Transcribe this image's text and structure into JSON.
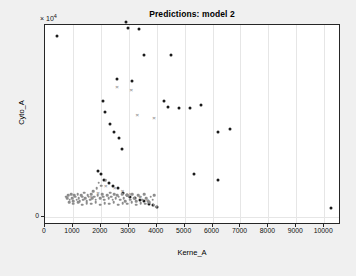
{
  "figure": {
    "background_color": "#f0f0f0",
    "axes_background_color": "#ffffff",
    "axes_border_color": "#262626",
    "grid_color": "#e6e6e6"
  },
  "chart_data": {
    "type": "scatter",
    "title": "Predictions: model 2",
    "xlabel": "Kerne_A",
    "ylabel": "Cyto_A",
    "y_exponent_label": "× 10",
    "y_exponent_power": "4",
    "y_scale_multiplier": 10000,
    "xlim": [
      0,
      10600
    ],
    "ylim": [
      -600,
      13600
    ],
    "grid": true,
    "legend": null,
    "xticks": [
      0,
      1000,
      2000,
      3000,
      4000,
      5000,
      6000,
      7000,
      8000,
      9000,
      10000
    ],
    "xtick_labels": [
      "0",
      "1000",
      "2000",
      "3000",
      "4000",
      "5000",
      "6000",
      "7000",
      "8000",
      "9000",
      "10000"
    ],
    "yticks": [
      0,
      20000,
      40000,
      60000,
      80000,
      100000,
      120000
    ],
    "ytick_labels": [
      "0",
      "2",
      "4",
      "6",
      "8",
      "10",
      "12"
    ],
    "series": [
      {
        "name": "observed",
        "marker": "dot",
        "color": "#1a1a1a",
        "size": 3.0,
        "points": [
          [
            690,
            127000
          ],
          [
            430,
            110500
          ],
          [
            640,
            101000
          ],
          [
            655,
            99500
          ],
          [
            610,
            98000
          ],
          [
            690,
            97500
          ],
          [
            620,
            94000
          ],
          [
            670,
            92500
          ],
          [
            640,
            88000
          ],
          [
            700,
            87500
          ],
          [
            660,
            86500
          ],
          [
            905,
            85000
          ],
          [
            1300,
            84000
          ],
          [
            570,
            81000
          ],
          [
            690,
            80500
          ],
          [
            1130,
            79000
          ],
          [
            1200,
            78500
          ],
          [
            600,
            76000
          ],
          [
            640,
            75500
          ],
          [
            1430,
            75000
          ],
          [
            570,
            73500
          ],
          [
            700,
            72000
          ],
          [
            1180,
            71000
          ],
          [
            530,
            69000
          ],
          [
            600,
            68000
          ],
          [
            1230,
            67500
          ],
          [
            1300,
            66000
          ],
          [
            1700,
            64500
          ],
          [
            1100,
            64000
          ],
          [
            600,
            62500
          ],
          [
            520,
            61000
          ],
          [
            1080,
            61500
          ],
          [
            1400,
            60500
          ],
          [
            1250,
            59000
          ],
          [
            430,
            58000
          ],
          [
            560,
            57500
          ],
          [
            690,
            57000
          ],
          [
            1030,
            57500
          ],
          [
            1160,
            56500
          ],
          [
            1520,
            56000
          ],
          [
            1330,
            55000
          ],
          [
            460,
            53000
          ],
          [
            600,
            52500
          ],
          [
            1030,
            52000
          ],
          [
            1450,
            51500
          ],
          [
            1540,
            50500
          ],
          [
            530,
            49000
          ],
          [
            640,
            48500
          ],
          [
            700,
            48000
          ],
          [
            1100,
            49500
          ],
          [
            1210,
            48000
          ],
          [
            1380,
            47500
          ],
          [
            1460,
            46500
          ],
          [
            410,
            45000
          ],
          [
            560,
            44500
          ],
          [
            1000,
            45500
          ],
          [
            1160,
            44000
          ],
          [
            1300,
            43500
          ],
          [
            1420,
            42500
          ],
          [
            1550,
            44000
          ],
          [
            600,
            41000
          ],
          [
            680,
            40500
          ],
          [
            1060,
            41500
          ],
          [
            1200,
            40000
          ],
          [
            1470,
            40500
          ],
          [
            1570,
            41500
          ],
          [
            430,
            38500
          ],
          [
            520,
            38000
          ],
          [
            960,
            38500
          ],
          [
            1100,
            37000
          ],
          [
            1260,
            36500
          ],
          [
            1680,
            36000
          ],
          [
            1800,
            34000
          ],
          [
            600,
            34500
          ],
          [
            700,
            33500
          ],
          [
            1030,
            33000
          ],
          [
            1180,
            32000
          ],
          [
            460,
            31000
          ],
          [
            1120,
            30500
          ],
          [
            1960,
            29500
          ],
          [
            2880,
            27500
          ],
          [
            4060,
            29500
          ],
          [
            7100,
            29800
          ],
          [
            400,
            26500
          ],
          [
            560,
            26000
          ],
          [
            1330,
            27000
          ],
          [
            1250,
            24000
          ],
          [
            530,
            23000
          ],
          [
            660,
            22000
          ],
          [
            690,
            21500
          ],
          [
            1320,
            20500
          ],
          [
            5030,
            25000
          ],
          [
            5830,
            20800
          ],
          [
            5880,
            20400
          ],
          [
            2290,
            17000
          ],
          [
            2260,
            16000
          ],
          [
            3450,
            18000
          ],
          [
            3680,
            19500
          ],
          [
            3760,
            18500
          ],
          [
            3800,
            20000
          ],
          [
            3880,
            17000
          ],
          [
            4000,
            15700
          ],
          [
            2900,
            13800
          ],
          [
            2980,
            13400
          ],
          [
            3370,
            13300
          ],
          [
            3550,
            11500
          ],
          [
            4510,
            11500
          ],
          [
            5870,
            14000
          ],
          [
            7560,
            15000
          ],
          [
            430,
            12800
          ],
          [
            2580,
            9800
          ],
          [
            3110,
            9600
          ],
          [
            4270,
            8200
          ],
          [
            4420,
            7800
          ],
          [
            4800,
            7700
          ],
          [
            5180,
            7700
          ],
          [
            5570,
            7900
          ],
          [
            6200,
            6000
          ],
          [
            6640,
            6200
          ],
          [
            2080,
            8200
          ],
          [
            2160,
            7400
          ],
          [
            2320,
            6600
          ],
          [
            2480,
            6000
          ],
          [
            2660,
            5600
          ],
          [
            2760,
            4800
          ],
          [
            5320,
            3000
          ],
          [
            6200,
            2600
          ],
          [
            1900,
            3200
          ],
          [
            2010,
            3000
          ],
          [
            2130,
            2600
          ],
          [
            2290,
            2400
          ],
          [
            2430,
            2200
          ],
          [
            2600,
            2000
          ],
          [
            2780,
            1700
          ],
          [
            2930,
            1500
          ],
          [
            3060,
            1400
          ],
          [
            3230,
            1300
          ],
          [
            3400,
            1200
          ],
          [
            3560,
            1100
          ],
          [
            3720,
            900
          ],
          [
            3880,
            800
          ],
          [
            4010,
            700
          ],
          [
            10250,
            600
          ]
        ]
      },
      {
        "name": "predicted",
        "marker": "dot",
        "color": "#8c8c8c",
        "size": 2.6,
        "points": [
          [
            760,
            1400
          ],
          [
            800,
            1300
          ],
          [
            840,
            1500
          ],
          [
            890,
            1200
          ],
          [
            930,
            1600
          ],
          [
            970,
            1300
          ],
          [
            1010,
            1100
          ],
          [
            1050,
            1500
          ],
          [
            1090,
            1400
          ],
          [
            1130,
            1200
          ],
          [
            1170,
            1600
          ],
          [
            1210,
            1300
          ],
          [
            1250,
            1100
          ],
          [
            1290,
            1500
          ],
          [
            1330,
            1400
          ],
          [
            1370,
            1200
          ],
          [
            1410,
            1700
          ],
          [
            1450,
            1300
          ],
          [
            1490,
            1100
          ],
          [
            1530,
            1500
          ],
          [
            1570,
            1400
          ],
          [
            1610,
            1200
          ],
          [
            1650,
            1600
          ],
          [
            1690,
            1300
          ],
          [
            1730,
            1800
          ],
          [
            1770,
            1400
          ],
          [
            1810,
            1200
          ],
          [
            1850,
            2000
          ],
          [
            1890,
            1500
          ],
          [
            1930,
            2400
          ],
          [
            1970,
            1300
          ],
          [
            2010,
            2200
          ],
          [
            2050,
            1600
          ],
          [
            2090,
            1400
          ],
          [
            2130,
            1200
          ],
          [
            2180,
            2600
          ],
          [
            2230,
            1500
          ],
          [
            2280,
            1300
          ],
          [
            2330,
            1700
          ],
          [
            2380,
            1400
          ],
          [
            2430,
            1200
          ],
          [
            2480,
            1600
          ],
          [
            2530,
            1300
          ],
          [
            2580,
            1500
          ],
          [
            2640,
            1400
          ],
          [
            2700,
            1200
          ],
          [
            2760,
            1600
          ],
          [
            2820,
            1300
          ],
          [
            2880,
            1100
          ],
          [
            2940,
            1500
          ],
          [
            3000,
            1400
          ],
          [
            3060,
            1200
          ],
          [
            3130,
            1600
          ],
          [
            3200,
            1300
          ],
          [
            3270,
            1100
          ],
          [
            3340,
            1500
          ],
          [
            3410,
            1400
          ],
          [
            3480,
            1200
          ],
          [
            3550,
            1600
          ],
          [
            3620,
            1300
          ],
          [
            3700,
            1100
          ],
          [
            3780,
            1400
          ],
          [
            3850,
            1200
          ],
          [
            3920,
            1500
          ],
          [
            3990,
            700
          ],
          [
            870,
            1000
          ],
          [
            1020,
            900
          ],
          [
            1180,
            1000
          ],
          [
            1340,
            850
          ],
          [
            1500,
            950
          ],
          [
            1660,
            900
          ],
          [
            1820,
            1000
          ],
          [
            1980,
            850
          ],
          [
            2140,
            950
          ],
          [
            2300,
            900
          ],
          [
            2460,
            1000
          ],
          [
            2620,
            850
          ],
          [
            2780,
            950
          ],
          [
            2940,
            900
          ],
          [
            3100,
            1000
          ],
          [
            3260,
            850
          ],
          [
            3420,
            950
          ],
          [
            3580,
            900
          ],
          [
            3740,
            1000
          ],
          [
            3900,
            850
          ]
        ]
      },
      {
        "name": "marked",
        "marker": "cross",
        "color": "#9a9a9a",
        "size": 6,
        "points": [
          [
            900,
            57500
          ],
          [
            1250,
            55500
          ],
          [
            1050,
            45500
          ],
          [
            700,
            26500
          ],
          [
            2290,
            15300
          ],
          [
            2580,
            9200
          ],
          [
            3090,
            9000
          ],
          [
            3300,
            7200
          ],
          [
            3900,
            7000
          ],
          [
            2180,
            2200
          ],
          [
            2500,
            2000
          ],
          [
            2780,
            1800
          ],
          [
            3050,
            1600
          ],
          [
            3400,
            1400
          ],
          [
            3660,
            1200
          ],
          [
            1660,
            1400
          ],
          [
            1900,
            1700
          ]
        ]
      }
    ]
  }
}
